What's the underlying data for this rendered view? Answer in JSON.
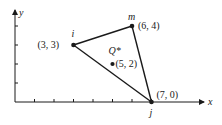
{
  "figure": {
    "type": "triangular element diagram",
    "axes": {
      "x_label": "x",
      "y_label": "y",
      "x_ticks": [
        1,
        2,
        3,
        4,
        5,
        6,
        7
      ],
      "y_ticks": [
        1,
        2,
        3,
        4
      ]
    },
    "nodes": [
      {
        "name": "i",
        "x": 3,
        "y": 3,
        "coord_label": "(3, 3)"
      },
      {
        "name": "j",
        "x": 7,
        "y": 0,
        "coord_label": "(7, 0)"
      },
      {
        "name": "m",
        "x": 6,
        "y": 4,
        "coord_label": "(6, 4)"
      }
    ],
    "point": {
      "name": "Q*",
      "x": 5,
      "y": 2,
      "coord_label": "(5, 2)"
    },
    "edges": [
      [
        "i",
        "m"
      ],
      [
        "m",
        "j"
      ],
      [
        "j",
        "i"
      ]
    ]
  }
}
